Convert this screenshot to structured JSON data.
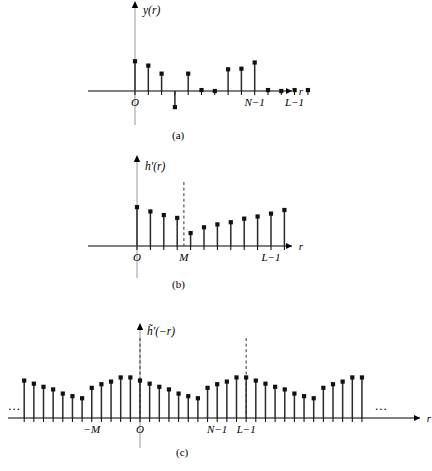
{
  "figure": {
    "caption_a": "(a)",
    "caption_b": "(b)",
    "caption_c": "(c)",
    "ellipsis_left": "...",
    "ellipsis_right": "..."
  },
  "panels": {
    "a": {
      "y_axis_label": "y(r)",
      "x_axis_label": "r",
      "origin_label": "O",
      "tick_labels": [
        "N−1",
        "L−1"
      ],
      "baseline_y": 91,
      "origin_x": 135
    },
    "b": {
      "y_axis_label": "h′(r)",
      "x_axis_label": "r",
      "origin_label": "O",
      "tick_labels": [
        "M",
        "L−1"
      ],
      "baseline_y": 246,
      "origin_x": 137
    },
    "c": {
      "y_axis_label": "h̃′(−r)",
      "x_axis_label": "r",
      "origin_label": "O",
      "tick_labels": [
        "−M",
        "N−1",
        "L−1"
      ],
      "baseline_y": 418,
      "origin_x": 140
    }
  },
  "colors": {
    "stem": "#2a2a2a",
    "dot": "#111111",
    "axis": "#000000",
    "dashed": "#333333",
    "vertical_guide": "#9a9a9a",
    "background": "#ffffff"
  },
  "chart_data": [
    {
      "type": "scatter",
      "name": "panel-a",
      "title": "y(r)",
      "xlabel": "r",
      "ylabel": "y(r)",
      "style": "stem",
      "grid": false,
      "legend": false,
      "xlim": [
        -1,
        17
      ],
      "ylim": [
        -30,
        55
      ],
      "x": [
        0,
        1,
        2,
        3,
        4,
        5,
        6,
        7,
        8,
        9,
        10,
        11,
        12,
        13
      ],
      "values": [
        48,
        41,
        28,
        -26,
        28,
        1.5,
        0,
        35,
        36,
        46,
        1.5,
        0,
        1.5,
        1.5
      ],
      "annotations": [
        {
          "text": "O",
          "x": 0
        },
        {
          "text": "N−1",
          "x": 9
        },
        {
          "text": "L−1",
          "x": 12
        }
      ]
    },
    {
      "type": "scatter",
      "name": "panel-b",
      "title": "h′(r)",
      "xlabel": "r",
      "ylabel": "h′(r)",
      "style": "stem",
      "grid": false,
      "legend": false,
      "xlim": [
        -1,
        17
      ],
      "ylim": [
        0,
        60
      ],
      "x": [
        0,
        1,
        2,
        3,
        4,
        5,
        6,
        7,
        8,
        9,
        10,
        11
      ],
      "values": [
        54,
        48,
        43,
        39,
        18,
        26,
        30,
        33,
        38,
        41,
        45,
        50
      ],
      "marker_line": {
        "label": "M",
        "x": 3.5
      },
      "annotations": [
        {
          "text": "O",
          "x": 0
        },
        {
          "text": "M",
          "x": 3.5
        },
        {
          "text": "L−1",
          "x": 10
        }
      ]
    },
    {
      "type": "scatter",
      "name": "panel-c",
      "title": "h̃′(−r)",
      "xlabel": "r",
      "ylabel": "h̃′(−r)",
      "style": "stem",
      "grid": false,
      "legend": false,
      "periodic": true,
      "xlim": [
        -13,
        26
      ],
      "ylim": [
        0,
        90
      ],
      "x": [
        -12,
        -11,
        -10,
        -9,
        -8,
        -7,
        -6,
        -5,
        -4,
        -3,
        -2,
        -1,
        0,
        1,
        2,
        3,
        4,
        5,
        6,
        7,
        8,
        9,
        10,
        11,
        12,
        13,
        14,
        15,
        16,
        17,
        18,
        19,
        20,
        21,
        22,
        23
      ],
      "values": [
        72,
        66,
        60,
        55,
        47,
        42,
        38,
        58,
        65,
        70,
        78,
        78,
        72,
        66,
        60,
        55,
        47,
        42,
        38,
        58,
        65,
        70,
        78,
        78,
        72,
        66,
        60,
        55,
        47,
        42,
        38,
        58,
        65,
        70,
        78,
        78
      ],
      "marker_lines": [
        {
          "label": "O",
          "x": 0
        },
        {
          "label": "L−1",
          "x": 11
        }
      ],
      "annotations": [
        {
          "text": "−M",
          "x": -5
        },
        {
          "text": "O",
          "x": 0
        },
        {
          "text": "N−1",
          "x": 8
        },
        {
          "text": "L−1",
          "x": 11
        },
        {
          "text": "...",
          "x": -13
        },
        {
          "text": "...",
          "x": 25
        }
      ]
    }
  ]
}
